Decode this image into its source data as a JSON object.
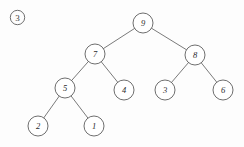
{
  "figure": {
    "index_label": "3",
    "index_icon": "circled-number-icon",
    "background_color": "#fdfdfd",
    "stroke_color": "#5e5e5e",
    "edge_color": "#6b6b6b",
    "node_fill_color": "#ffffff",
    "text_color": "#2b2b2b",
    "caption": ""
  },
  "chart_data": {
    "type": "diagram",
    "diagram_type": "binary-tree",
    "title": "",
    "root": "9",
    "node_radius": 10,
    "nodes": [
      {
        "id": "n9",
        "label": "9",
        "x": 143,
        "y": 23,
        "level": 0
      },
      {
        "id": "n7",
        "label": "7",
        "x": 95,
        "y": 54,
        "level": 1
      },
      {
        "id": "n8",
        "label": "8",
        "x": 195,
        "y": 55,
        "level": 1
      },
      {
        "id": "n5",
        "label": "5",
        "x": 65,
        "y": 88,
        "level": 2
      },
      {
        "id": "n4",
        "label": "4",
        "x": 124,
        "y": 90,
        "level": 2
      },
      {
        "id": "n3",
        "label": "3",
        "x": 165,
        "y": 90,
        "level": 2
      },
      {
        "id": "n6",
        "label": "6",
        "x": 223,
        "y": 90,
        "level": 2
      },
      {
        "id": "n2",
        "label": "2",
        "x": 38,
        "y": 126,
        "level": 3
      },
      {
        "id": "n1",
        "label": "1",
        "x": 94,
        "y": 126,
        "level": 3
      }
    ],
    "edges": [
      {
        "from": "n9",
        "to": "n7",
        "side": "left"
      },
      {
        "from": "n9",
        "to": "n8",
        "side": "right"
      },
      {
        "from": "n7",
        "to": "n5",
        "side": "left"
      },
      {
        "from": "n7",
        "to": "n4",
        "side": "right"
      },
      {
        "from": "n8",
        "to": "n3",
        "side": "left"
      },
      {
        "from": "n8",
        "to": "n6",
        "side": "right"
      },
      {
        "from": "n5",
        "to": "n2",
        "side": "left"
      },
      {
        "from": "n5",
        "to": "n1",
        "side": "right"
      }
    ]
  }
}
